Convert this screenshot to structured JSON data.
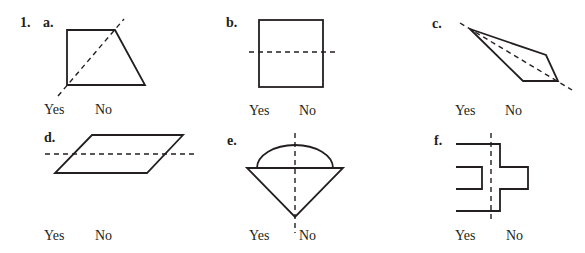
{
  "problem": {
    "number": "1.",
    "instruction_implied": "Is the dashed line a line of symmetry?",
    "parts": [
      {
        "id": "a",
        "label": "a.",
        "shape": "right trapezoid with diagonal dashed line",
        "yes": "Yes",
        "no": "No"
      },
      {
        "id": "b",
        "label": "b.",
        "shape": "square with horizontal dashed line through middle",
        "yes": "Yes",
        "no": "No"
      },
      {
        "id": "c",
        "label": "c.",
        "shape": "kite with dashed diagonal",
        "yes": "Yes",
        "no": "No"
      },
      {
        "id": "d",
        "label": "d.",
        "shape": "parallelogram with horizontal dashed line",
        "yes": "Yes",
        "no": "No"
      },
      {
        "id": "e",
        "label": "e.",
        "shape": "triangle topped with semicircle, vertical dashed line",
        "yes": "Yes",
        "no": "No"
      },
      {
        "id": "f",
        "label": "f.",
        "shape": "comb-like polygon with vertical dashed line",
        "yes": "Yes",
        "no": "No"
      }
    ]
  },
  "colors": {
    "ink": "#231f20",
    "background": "#ffffff"
  }
}
